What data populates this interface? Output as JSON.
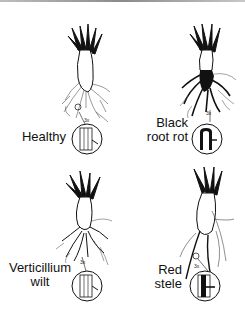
{
  "figure": {
    "panels": [
      {
        "id": "healthy",
        "label_lines": [
          "Healthy"
        ],
        "magnification": "3x",
        "root_color": "#ffffff",
        "stele_style": "light-lines"
      },
      {
        "id": "black-root-rot",
        "label_lines": [
          "Black",
          "root rot"
        ],
        "magnification": "3x",
        "root_color": "#111111",
        "stele_style": "dark-arch"
      },
      {
        "id": "verticillium-wilt",
        "label_lines": [
          "Verticillium",
          "wilt"
        ],
        "magnification": "3x",
        "root_color": "#ffffff",
        "stele_style": "light-lines"
      },
      {
        "id": "red-stele",
        "label_lines": [
          "Red",
          "stele"
        ],
        "magnification": "3x",
        "root_color": "#ffffff",
        "stele_style": "dark-core"
      }
    ],
    "colors": {
      "ink": "#111111",
      "background": "#ffffff",
      "border": "#9a9a9a"
    }
  }
}
